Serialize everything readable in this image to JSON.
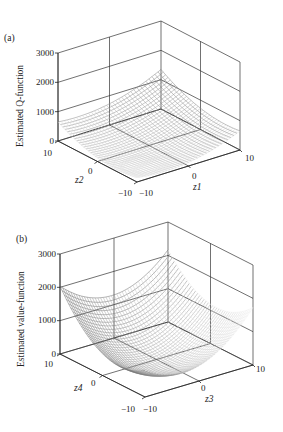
{
  "chart_data": [
    {
      "panel": "(a)",
      "type": "surface",
      "title": "",
      "xlabel": "z1",
      "ylabel": "z2",
      "zlabel": "Estimated Q-function",
      "xlim": [
        -10,
        10
      ],
      "ylim": [
        -10,
        10
      ],
      "zlim": [
        0,
        3000
      ],
      "xticks": [
        "-10",
        "0",
        "10"
      ],
      "yticks": [
        "-10",
        "0",
        "10"
      ],
      "zticks": [
        "0",
        "1000",
        "2000",
        "3000"
      ],
      "grid": true,
      "description": "Wireframe surface of an estimated quadratic Q-function over (z1, z2); minimum near 0 in the center-left valley, rising to ~2600 at the back corner (z1=-10,z2=10 back edge) and ~800-1000 at the right corner; a sharp fold/crease runs across the surface.",
      "corner_values": {
        "z1=-10,z2=-10": 300,
        "z1=-10,z2=10": 1200,
        "z1=10,z2=10": 2600,
        "z1=10,z2=-10": 800
      },
      "min_value": 0
    },
    {
      "panel": "(b)",
      "type": "surface",
      "title": "",
      "xlabel": "z3",
      "ylabel": "z4",
      "zlabel": "Estimated value-function",
      "xlim": [
        -10,
        10
      ],
      "ylim": [
        -10,
        10
      ],
      "zlim": [
        0,
        3000
      ],
      "xticks": [
        "-10",
        "0",
        "10"
      ],
      "yticks": [
        "-10",
        "0",
        "10"
      ],
      "zticks": [
        "0",
        "1000",
        "2000",
        "3000"
      ],
      "grid": true,
      "description": "Bowl-shaped quadratic surface of an estimated value-function over (z3, z4); minimum ~0 near the center-front, rising to ~2000 at the left corner (z4=10) and ~1100 at the right corner (z3=10).",
      "corner_values": {
        "z3=-10,z4=10": 2050,
        "z3=10,z4=10": 1300,
        "z3=10,z4=-10": 1100,
        "z3=-10,z4=-10": 700
      },
      "min_value": 0
    }
  ],
  "panels": {
    "a": {
      "label": "(a)",
      "zlabel": "Estimated Q-function",
      "xlabel": "z1",
      "ylabel": "z2",
      "zticks": [
        "3000",
        "2000",
        "1000",
        "0"
      ],
      "yticks": [
        "10",
        "0",
        "−10"
      ],
      "xticks": [
        "−10",
        "0",
        "10"
      ]
    },
    "b": {
      "label": "(b)",
      "zlabel": "Estimated value-function",
      "xlabel": "z3",
      "ylabel": "z4",
      "zticks": [
        "3000",
        "2000",
        "1000",
        "0"
      ],
      "yticks": [
        "10",
        "0",
        "−10"
      ],
      "xticks": [
        "−10",
        "0",
        "10"
      ]
    }
  }
}
